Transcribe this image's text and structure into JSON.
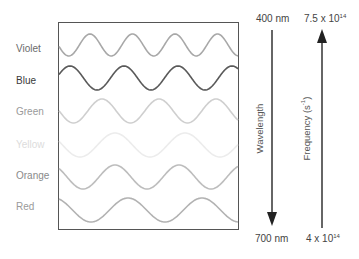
{
  "colors": [
    {
      "name": "Violet",
      "text_color": "#6b6b6b",
      "wave_color": "#a8a8a8",
      "label_y": 43,
      "center_y": 45,
      "amplitude": 11,
      "period": 42.5,
      "phase_x": 90
    },
    {
      "name": "Blue",
      "text_color": "#3a3a3a",
      "wave_color": "#5a5a5a",
      "label_y": 75,
      "center_y": 78,
      "amplitude": 12,
      "period": 54,
      "phase_x": 70
    },
    {
      "name": "Green",
      "text_color": "#9a9a9a",
      "wave_color": "#cfcfcf",
      "label_y": 106,
      "center_y": 111,
      "amplitude": 12,
      "period": 57,
      "phase_x": 102
    },
    {
      "name": "Yellow",
      "text_color": "#dcdcdc",
      "wave_color": "#ececec",
      "label_y": 139,
      "center_y": 145,
      "amplitude": 12,
      "period": 70,
      "phase_x": 115
    },
    {
      "name": "Orange",
      "text_color": "#8a8a8a",
      "wave_color": "#bdbdbd",
      "label_y": 170,
      "center_y": 177,
      "amplitude": 12,
      "period": 64,
      "phase_x": 115
    },
    {
      "name": "Red",
      "text_color": "#9a9a9a",
      "wave_color": "#b2b2b2",
      "label_y": 201,
      "center_y": 210,
      "amplitude": 12,
      "period": 74,
      "phase_x": 128
    }
  ],
  "wavelength": {
    "top_label": "400 nm",
    "bottom_label": "700 nm",
    "axis_label": "Wavelength",
    "direction": "down"
  },
  "frequency": {
    "top_label_base": "7.5 x 10",
    "top_label_exp": "14",
    "bottom_label_base": "4 x 10",
    "bottom_label_exp": "14",
    "axis_label_base": "Frequency (s",
    "axis_label_exp": "-1",
    "axis_label_end": ")",
    "direction": "up"
  }
}
